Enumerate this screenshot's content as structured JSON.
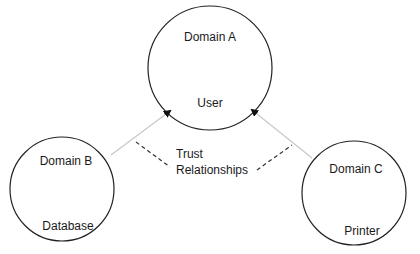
{
  "domains": [
    {
      "name": "Domain A",
      "resource": "User"
    },
    {
      "name": "Domain B",
      "resource": "Database"
    },
    {
      "name": "Domain C",
      "resource": "Printer"
    }
  ],
  "trust_label": {
    "line1": "Trust",
    "line2": "Relationships"
  },
  "colors": {
    "circle_stroke": "#222222",
    "arrow_line": "#c8c8c8",
    "dashed_line": "#333333",
    "arrow_head": "#111111"
  }
}
